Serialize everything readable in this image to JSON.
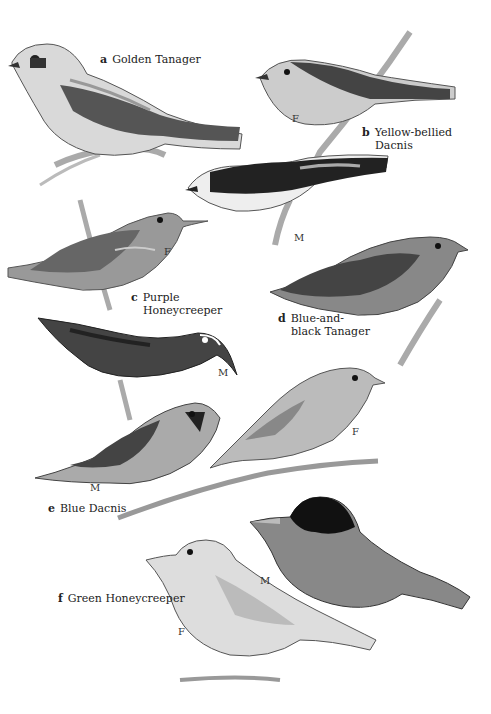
{
  "plate": {
    "species": [
      {
        "letter": "a",
        "name": "Golden Tanager",
        "name_lines": [
          "Golden Tanager"
        ]
      },
      {
        "letter": "b",
        "name": "Yellow-bellied Dacnis",
        "name_lines": [
          "Yellow-bellied",
          "Dacnis"
        ]
      },
      {
        "letter": "c",
        "name": "Purple Honeycreeper",
        "name_lines": [
          "Purple",
          "Honeycreeper"
        ]
      },
      {
        "letter": "d",
        "name": "Blue-and-black Tanager",
        "name_lines": [
          "Blue-and-",
          "black Tanager"
        ]
      },
      {
        "letter": "e",
        "name": "Blue Dacnis",
        "name_lines": [
          "Blue Dacnis"
        ]
      },
      {
        "letter": "f",
        "name": "Green Honeycreeper",
        "name_lines": [
          "Green Honeycreeper"
        ]
      }
    ],
    "sex_marks": {
      "b_female": "F",
      "b_male": "M",
      "c_female": "F",
      "c_male": "M",
      "e_male": "M",
      "e_female": "F",
      "f_male": "M",
      "f_female": "F"
    }
  }
}
